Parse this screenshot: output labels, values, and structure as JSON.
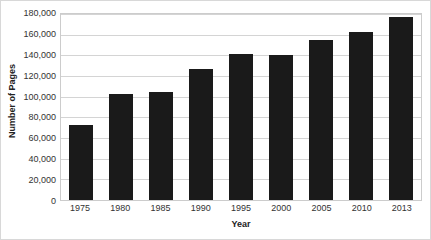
{
  "chart_data": {
    "type": "bar",
    "title": "",
    "xlabel": "Year",
    "ylabel": "Number of Pages",
    "categories": [
      "1975",
      "1980",
      "1985",
      "1990",
      "1995",
      "2000",
      "2005",
      "2010",
      "2013"
    ],
    "values": [
      73000,
      103000,
      105000,
      127000,
      141000,
      140000,
      155000,
      163000,
      177000
    ],
    "ylim": [
      0,
      180000
    ],
    "ytick_labels": [
      "180,000",
      "160,000",
      "140,000",
      "120,000",
      "100,000",
      "80,000",
      "60,000",
      "40,000",
      "20,000",
      "0"
    ],
    "ytick_values": [
      180000,
      160000,
      140000,
      120000,
      100000,
      80000,
      60000,
      40000,
      20000,
      0
    ],
    "grid": true,
    "legend": "none",
    "bar_color": "#1a1a1a",
    "gridline_color": "#d4d4d4",
    "plot_border_color": "#cccccc",
    "background_color": "#ffffff"
  }
}
